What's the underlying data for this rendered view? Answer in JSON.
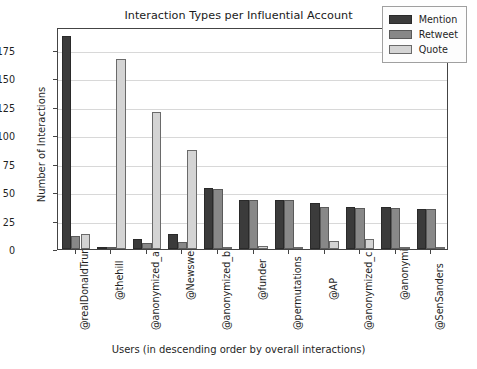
{
  "chart_data": {
    "type": "bar",
    "title": "Interaction Types per Influential Account",
    "xlabel": "Users (in descending order by overall interactions)",
    "ylabel": "Number of Interactions",
    "categories": [
      "@realDonaldTrump",
      "@thehill",
      "@anonymized_a",
      "@Newsweek",
      "@anonymized_b",
      "@funder",
      "@permutations",
      "@AP",
      "@anonymized_c",
      "@anonymized_d",
      "@SenSanders"
    ],
    "series": [
      {
        "name": "Mention",
        "color": "#3b3b3b",
        "values": [
          187,
          2,
          9,
          13,
          54,
          43,
          43,
          40,
          37,
          37,
          35
        ]
      },
      {
        "name": "Retweet",
        "color": "#888888",
        "values": [
          11,
          1,
          5,
          6,
          53,
          43,
          43,
          37,
          36,
          36,
          35
        ]
      },
      {
        "name": "Quote",
        "color": "#d4d4d4",
        "values": [
          13,
          167,
          120,
          87,
          2,
          3,
          1,
          7,
          9,
          2,
          2
        ]
      }
    ],
    "yticks": [
      0,
      25,
      50,
      75,
      100,
      125,
      150,
      175
    ],
    "ylim": [
      0,
      195
    ],
    "grid": true,
    "legend_position": "upper right",
    "legend_entries": [
      "Mention",
      "Retweet",
      "Quote"
    ]
  }
}
